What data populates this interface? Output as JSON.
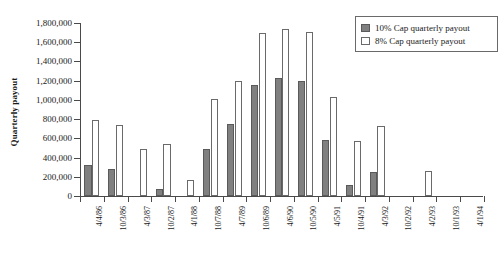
{
  "chart_data": {
    "type": "bar",
    "title": "",
    "xlabel": "",
    "ylabel": "Quarterly payout",
    "ylim": [
      0,
      1800000
    ],
    "ytick_step": 200000,
    "grid": false,
    "legend_position": "top-right",
    "categories": [
      "4/4/86",
      "10/3/86",
      "4/3/87",
      "10/2/87",
      "4/1/88",
      "10/7/88",
      "4/7/89",
      "10/6/89",
      "4/6/90",
      "10/5/90",
      "4/5/91",
      "10/4/91",
      "4/3/92",
      "10/2/92",
      "4/2/93",
      "10/1/93",
      "4/1/94"
    ],
    "series": [
      {
        "name": "10% Cap quarterly payout",
        "color": "#808080",
        "values": [
          320000,
          280000,
          0,
          75000,
          0,
          490000,
          750000,
          1150000,
          1230000,
          1200000,
          580000,
          110000,
          250000,
          0,
          0,
          0,
          0
        ]
      },
      {
        "name": "8% Cap quarterly payout",
        "color": "#ffffff",
        "values": [
          795000,
          740000,
          490000,
          545000,
          170000,
          1010000,
          1200000,
          1700000,
          1735000,
          1710000,
          1030000,
          570000,
          725000,
          0,
          265000,
          0,
          0
        ]
      }
    ],
    "ytick_labels": [
      "0",
      "200,000",
      "400,000",
      "600,000",
      "800,000",
      "1,000,000",
      "1,200,000",
      "1,400,000",
      "1,600,000",
      "1,800,000"
    ]
  },
  "legend": {
    "items": [
      {
        "label": "10% Cap quarterly payout",
        "swatch": "filled-gray-swatch"
      },
      {
        "label": "8% Cap quarterly payout",
        "swatch": "outline-white-swatch"
      }
    ]
  }
}
